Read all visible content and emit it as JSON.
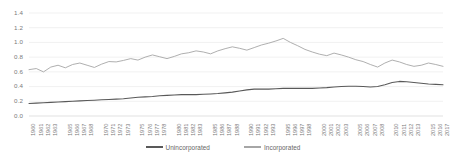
{
  "chart_data": {
    "type": "line",
    "title": "",
    "xlabel": "",
    "ylabel": "",
    "ylim": [
      0.0,
      1.4
    ],
    "xlim": [
      1960,
      2017
    ],
    "grid": true,
    "legend_position": "bottom",
    "y_ticks": [
      "0.0",
      "0.2",
      "0.4",
      "0.6",
      "0.8",
      "1.0",
      "1.2",
      "1.4"
    ],
    "x_ticks": [
      "1960",
      "1961",
      "1962",
      "1963",
      "1965",
      "1966",
      "1967",
      "1968",
      "1970",
      "1971",
      "1972",
      "1973",
      "1975",
      "1976",
      "1977",
      "1978",
      "1980",
      "1981",
      "1982",
      "1983",
      "1985",
      "1986",
      "1987",
      "1988",
      "1990",
      "1991",
      "1992",
      "1993",
      "1995",
      "1996",
      "1997",
      "1998",
      "2000",
      "2001",
      "2002",
      "2003",
      "2005",
      "2006",
      "2007",
      "2008",
      "2010",
      "2011",
      "2012",
      "2013",
      "2015",
      "2016",
      "2017"
    ],
    "x": [
      1960,
      1961,
      1962,
      1963,
      1964,
      1965,
      1966,
      1967,
      1968,
      1969,
      1970,
      1971,
      1972,
      1973,
      1974,
      1975,
      1976,
      1977,
      1978,
      1979,
      1980,
      1981,
      1982,
      1983,
      1984,
      1985,
      1986,
      1987,
      1988,
      1989,
      1990,
      1991,
      1992,
      1993,
      1994,
      1995,
      1996,
      1997,
      1998,
      1999,
      2000,
      2001,
      2002,
      2003,
      2004,
      2005,
      2006,
      2007,
      2008,
      2009,
      2010,
      2011,
      2012,
      2013,
      2014,
      2015,
      2016,
      2017
    ],
    "series": [
      {
        "name": "Unincorporated",
        "color": "#595959",
        "values": [
          0.17,
          0.175,
          0.18,
          0.185,
          0.19,
          0.195,
          0.2,
          0.205,
          0.21,
          0.215,
          0.22,
          0.225,
          0.23,
          0.235,
          0.245,
          0.255,
          0.26,
          0.265,
          0.275,
          0.28,
          0.285,
          0.29,
          0.29,
          0.29,
          0.295,
          0.3,
          0.305,
          0.315,
          0.325,
          0.34,
          0.355,
          0.365,
          0.365,
          0.365,
          0.37,
          0.375,
          0.375,
          0.375,
          0.375,
          0.375,
          0.38,
          0.385,
          0.395,
          0.4,
          0.405,
          0.405,
          0.4,
          0.395,
          0.4,
          0.425,
          0.455,
          0.47,
          0.465,
          0.455,
          0.445,
          0.435,
          0.43,
          0.425
        ]
      },
      {
        "name": "Incorporated",
        "color": "#a6a6a6",
        "values": [
          0.63,
          0.655,
          0.7,
          0.685,
          0.7,
          0.715,
          0.73,
          0.715,
          0.745,
          0.765,
          0.755,
          0.775,
          0.795,
          0.815,
          0.78,
          0.735,
          0.795,
          0.82,
          0.835,
          0.855,
          0.865,
          0.845,
          0.815,
          0.845,
          0.86,
          0.875,
          0.855,
          0.835,
          0.8,
          0.78,
          0.755,
          0.73,
          0.715,
          0.74,
          0.755,
          0.765,
          0.78,
          0.8,
          0.83,
          0.86,
          0.88,
          0.885,
          0.875,
          0.86,
          0.84,
          0.855,
          0.885,
          0.9,
          0.91,
          0.93,
          0.96,
          0.99,
          1.03,
          1.07,
          1.1,
          1.13,
          1.155,
          1.18
        ]
      }
    ],
    "incorporated_detail": [
      0.63,
      0.645,
      0.6,
      0.665,
      0.69,
      0.655,
      0.7,
      0.72,
      0.69,
      0.66,
      0.705,
      0.74,
      0.735,
      0.755,
      0.78,
      0.76,
      0.8,
      0.83,
      0.805,
      0.78,
      0.81,
      0.845,
      0.86,
      0.885,
      0.87,
      0.845,
      0.885,
      0.915,
      0.94,
      0.92,
      0.895,
      0.93,
      0.965,
      0.99,
      1.02,
      1.055,
      1.0,
      0.955,
      0.905,
      0.87,
      0.84,
      0.82,
      0.855,
      0.83,
      0.8,
      0.765,
      0.74,
      0.7,
      0.665,
      0.72,
      0.76,
      0.735,
      0.7,
      0.675,
      0.69,
      0.72,
      0.7,
      0.675
    ]
  },
  "legend": {
    "entries": [
      {
        "label": "Unincorporated",
        "color": "#595959"
      },
      {
        "label": "Incorporated",
        "color": "#a6a6a6"
      }
    ]
  }
}
